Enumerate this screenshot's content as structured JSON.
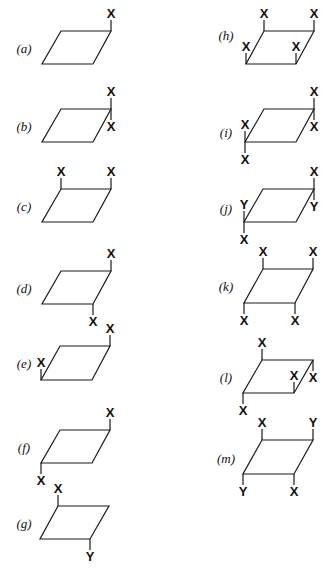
{
  "diagram": {
    "type": "substituted-parallelogram-configurations",
    "panels": [
      {
        "id": "a",
        "label": "(a)",
        "label_pos": [
          24,
          49
        ],
        "shape": [
          [
            61,
            31
          ],
          [
            111,
            31
          ],
          [
            93,
            64
          ],
          [
            42,
            64
          ]
        ],
        "subs": [
          {
            "text": "X",
            "at": "TR",
            "dir": "up"
          }
        ]
      },
      {
        "id": "b",
        "label": "(b)",
        "label_pos": [
          24,
          127
        ],
        "shape": [
          [
            61,
            109
          ],
          [
            111,
            109
          ],
          [
            93,
            142
          ],
          [
            42,
            142
          ]
        ],
        "subs": [
          {
            "text": "X",
            "at": "TR",
            "dir": "up"
          },
          {
            "text": "X",
            "at": "TR",
            "dir": "down"
          }
        ]
      },
      {
        "id": "c",
        "label": "(c)",
        "label_pos": [
          24,
          207
        ],
        "shape": [
          [
            61,
            189
          ],
          [
            111,
            189
          ],
          [
            93,
            222
          ],
          [
            42,
            222
          ]
        ],
        "subs": [
          {
            "text": "X",
            "at": "TL",
            "dir": "up"
          },
          {
            "text": "X",
            "at": "TR",
            "dir": "up"
          }
        ]
      },
      {
        "id": "d",
        "label": "(d)",
        "label_pos": [
          24,
          289
        ],
        "shape": [
          [
            61,
            271
          ],
          [
            111,
            271
          ],
          [
            93,
            304
          ],
          [
            42,
            304
          ]
        ],
        "subs": [
          {
            "text": "X",
            "at": "TR",
            "dir": "up"
          },
          {
            "text": "X",
            "at": "BR",
            "dir": "down"
          }
        ]
      },
      {
        "id": "e",
        "label": "(e)",
        "label_pos": [
          24,
          364
        ],
        "shape": [
          [
            60,
            346
          ],
          [
            110,
            346
          ],
          [
            92,
            380
          ],
          [
            41,
            380
          ]
        ],
        "subs": [
          {
            "text": "X",
            "at": "TR",
            "dir": "up"
          },
          {
            "text": "X",
            "at": "BL",
            "dir": "up"
          }
        ]
      },
      {
        "id": "f",
        "label": "(f)",
        "label_pos": [
          24,
          448
        ],
        "shape": [
          [
            60,
            430
          ],
          [
            110,
            430
          ],
          [
            92,
            463
          ],
          [
            41,
            463
          ]
        ],
        "subs": [
          {
            "text": "X",
            "at": "TR",
            "dir": "up"
          },
          {
            "text": "X",
            "at": "BL",
            "dir": "down"
          }
        ]
      },
      {
        "id": "g",
        "label": "(g)",
        "label_pos": [
          24,
          524
        ],
        "shape": [
          [
            58,
            506
          ],
          [
            109,
            506
          ],
          [
            90,
            539
          ],
          [
            40,
            539
          ]
        ],
        "subs": [
          {
            "text": "X",
            "at": "TL",
            "dir": "up"
          },
          {
            "text": "Y",
            "at": "BR",
            "dir": "down"
          }
        ]
      },
      {
        "id": "h",
        "label": "(h)",
        "label_pos": [
          226,
          36
        ],
        "shape": [
          [
            264,
            31
          ],
          [
            314,
            31
          ],
          [
            296,
            64
          ],
          [
            246,
            64
          ]
        ],
        "subs": [
          {
            "text": "X",
            "at": "TL",
            "dir": "up"
          },
          {
            "text": "X",
            "at": "TR",
            "dir": "up"
          },
          {
            "text": "X",
            "at": "BL",
            "dir": "up"
          },
          {
            "text": "X",
            "at": "BR",
            "dir": "up"
          }
        ]
      },
      {
        "id": "i",
        "label": "(i)",
        "label_pos": [
          226,
          133
        ],
        "shape": [
          [
            264,
            109
          ],
          [
            314,
            109
          ],
          [
            296,
            142
          ],
          [
            245,
            142
          ]
        ],
        "subs": [
          {
            "text": "X",
            "at": "TR",
            "dir": "up"
          },
          {
            "text": "X",
            "at": "TR",
            "dir": "down"
          },
          {
            "text": "X",
            "at": "BL",
            "dir": "up"
          },
          {
            "text": "X",
            "at": "BL",
            "dir": "down"
          }
        ]
      },
      {
        "id": "j",
        "label": "(j)",
        "label_pos": [
          226,
          209
        ],
        "shape": [
          [
            263,
            189
          ],
          [
            314,
            189
          ],
          [
            296,
            222
          ],
          [
            244,
            222
          ]
        ],
        "subs": [
          {
            "text": "X",
            "at": "TR",
            "dir": "up"
          },
          {
            "text": "Y",
            "at": "TR",
            "dir": "down"
          },
          {
            "text": "Y",
            "at": "BL",
            "dir": "up"
          },
          {
            "text": "X",
            "at": "BL",
            "dir": "down"
          }
        ]
      },
      {
        "id": "k",
        "label": "(k)",
        "label_pos": [
          226,
          287
        ],
        "shape": [
          [
            263,
            269
          ],
          [
            313,
            269
          ],
          [
            295,
            303
          ],
          [
            244,
            303
          ]
        ],
        "subs": [
          {
            "text": "X",
            "at": "TL",
            "dir": "up"
          },
          {
            "text": "X",
            "at": "TR",
            "dir": "up"
          },
          {
            "text": "X",
            "at": "BL",
            "dir": "down"
          },
          {
            "text": "X",
            "at": "BR",
            "dir": "down"
          }
        ]
      },
      {
        "id": "l",
        "label": "(l)",
        "label_pos": [
          226,
          378
        ],
        "shape": [
          [
            262,
            360
          ],
          [
            313,
            360
          ],
          [
            294,
            393
          ],
          [
            243,
            393
          ]
        ],
        "subs": [
          {
            "text": "X",
            "at": "TL",
            "dir": "up"
          },
          {
            "text": "X",
            "at": "TR",
            "dir": "down"
          },
          {
            "text": "X",
            "at": "BL",
            "dir": "down"
          },
          {
            "text": "X",
            "at": "BR",
            "dir": "up"
          }
        ]
      },
      {
        "id": "m",
        "label": "(m)",
        "label_pos": [
          226,
          459
        ],
        "shape": [
          [
            262,
            440
          ],
          [
            313,
            440
          ],
          [
            294,
            474
          ],
          [
            243,
            474
          ]
        ],
        "subs": [
          {
            "text": "X",
            "at": "TL",
            "dir": "up"
          },
          {
            "text": "Y",
            "at": "TR",
            "dir": "up"
          },
          {
            "text": "Y",
            "at": "BL",
            "dir": "down"
          },
          {
            "text": "X",
            "at": "BR",
            "dir": "down"
          }
        ]
      }
    ]
  }
}
